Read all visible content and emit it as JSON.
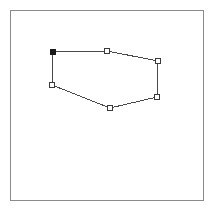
{
  "app": {
    "title": "Polygon Shape Editor Canvas",
    "canvas_label": "drawing-canvas"
  },
  "canvas": {
    "width": 214,
    "height": 210,
    "background_color": "#ffffff",
    "frame": {
      "x": 10,
      "y": 10,
      "width": 194,
      "height": 191,
      "border_color": "#8a8a8a",
      "border_width": 1
    }
  },
  "shape": {
    "type": "polygon",
    "closed": true,
    "edge_color": "#4a4a4a",
    "edge_width": 1,
    "fill": "none",
    "vertex_count": 6,
    "handle_size": 5,
    "handle_fill": "#ffffff",
    "handle_stroke": "#3a3a3a",
    "anchor_fill": "#1a1a1a",
    "points_attr": "53,52 107,51 158,61 157,97 110,108 52,85",
    "vertices": [
      {
        "index": 0,
        "name": "vertex-anchor-top-left",
        "x": 53,
        "y": 52,
        "state": "anchor",
        "filled": true
      },
      {
        "index": 1,
        "name": "vertex-top-middle",
        "x": 107,
        "y": 51,
        "state": "handle",
        "filled": false
      },
      {
        "index": 2,
        "name": "vertex-top-right",
        "x": 158,
        "y": 61,
        "state": "handle",
        "filled": false
      },
      {
        "index": 3,
        "name": "vertex-bottom-right",
        "x": 157,
        "y": 97,
        "state": "handle",
        "filled": false
      },
      {
        "index": 4,
        "name": "vertex-bottom-middle",
        "x": 110,
        "y": 108,
        "state": "handle",
        "filled": false
      },
      {
        "index": 5,
        "name": "vertex-left-middle",
        "x": 52,
        "y": 85,
        "state": "handle",
        "filled": false
      }
    ]
  }
}
